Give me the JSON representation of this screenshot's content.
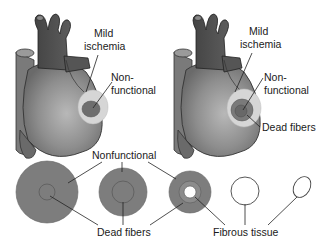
{
  "figure": {
    "heart_left": {
      "labels": {
        "mild_ischemia_1": "Mild",
        "mild_ischemia_2": "ischemia",
        "nonfunctional_1": "Non-",
        "nonfunctional_2": "functional"
      }
    },
    "heart_right": {
      "labels": {
        "mild_ischemia_1": "Mild",
        "mild_ischemia_2": "ischemia",
        "nonfunctional_1": "Non-",
        "nonfunctional_2": "functional",
        "dead_fibers": "Dead fibers"
      }
    },
    "cross_sections": {
      "nonfunctional": "Nonfunctional",
      "dead_fibers": "Dead fibers",
      "fibrous_tissue": "Fibrous tissue"
    },
    "colors": {
      "heart_body": "#8a8a8a",
      "vessels": "#555555",
      "ischemia_zone": "#d4d4d4",
      "nonfunctional_zone": "#6e6e6e",
      "section_fill": "#7d7d7d",
      "outline": "#333333",
      "leader_line": "#222222"
    }
  }
}
